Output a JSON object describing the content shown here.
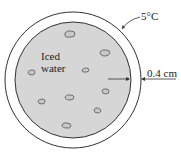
{
  "diagram": {
    "labels": {
      "outer_temperature": "5°C",
      "contents_line1": "Iced",
      "contents_line2": "water",
      "thickness": "0.4 cm"
    },
    "colors": {
      "water_fill": "#d6d6d6",
      "stroke": "#333333",
      "shell_fill": "#ffffff"
    },
    "geometry": {
      "center": [
        73,
        80
      ],
      "outer_radius": 68,
      "inner_radius": 58
    },
    "ice_cubes": [
      [
        70,
        34
      ],
      [
        105,
        52
      ],
      [
        31,
        72
      ],
      [
        85,
        70
      ],
      [
        105,
        91
      ],
      [
        41,
        101
      ],
      [
        69,
        97
      ],
      [
        97,
        110
      ],
      [
        66,
        125
      ]
    ]
  }
}
